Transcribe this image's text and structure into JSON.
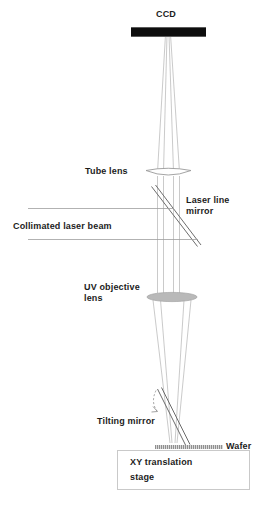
{
  "diagram": {
    "background_color": "#ffffff",
    "labels": {
      "ccd": "CCD",
      "tube_lens": "Tube lens",
      "laser_line_mirror_line1": "Laser line",
      "laser_line_mirror_line2": "mirror",
      "collimated_laser_beam": "Collimated laser beam",
      "uv_objective_lens_line1": "UV objective",
      "uv_objective_lens_line2": "lens",
      "tilting_mirror": "Tilting mirror",
      "wafer": "Wafer",
      "xy_translation_stage_line1": "XY translation",
      "xy_translation_stage_line2": "stage"
    },
    "colors": {
      "ccd_bar": "#0d0d0d",
      "ray": "#b6b6b6",
      "lens_outline": "#9a9a9a",
      "objective_fill": "#b9b9b9",
      "mirror_line": "#6d6d6d",
      "laser_beam_line": "#9e9e9e",
      "wafer": "#8f8f8f",
      "stage_border": "#c9c9c9",
      "text": "#1c1c1c"
    },
    "components": [
      {
        "name": "ccd",
        "type": "detector",
        "x": 168,
        "y": 31
      },
      {
        "name": "tube-lens",
        "type": "lens",
        "x": 168,
        "y": 173
      },
      {
        "name": "laser-line-mirror",
        "type": "beamsplitter-mirror",
        "x": 175,
        "y": 218,
        "angle_deg": 52
      },
      {
        "name": "collimated-laser-beam",
        "type": "beam",
        "y_top": 208,
        "y_bottom": 240
      },
      {
        "name": "uv-objective-lens",
        "type": "lens",
        "x": 172,
        "y": 297
      },
      {
        "name": "tilting-mirror",
        "type": "mirror",
        "x": 172,
        "y": 417,
        "angle_deg": 63
      },
      {
        "name": "wafer",
        "type": "sample",
        "x": 189,
        "y": 447
      },
      {
        "name": "xy-translation-stage",
        "type": "stage",
        "x": 183,
        "y": 470
      }
    ]
  }
}
